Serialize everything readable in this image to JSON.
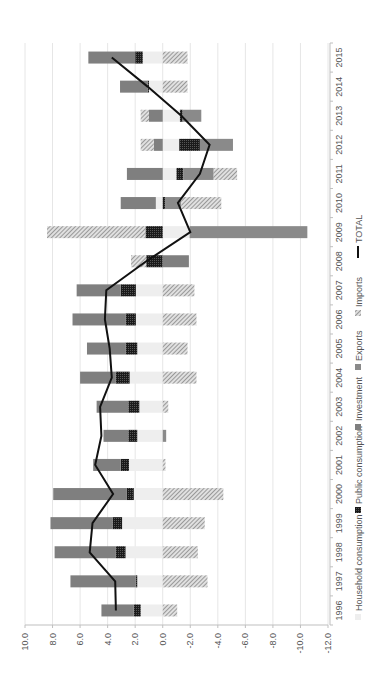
{
  "chart_data": {
    "type": "bar",
    "subtype": "stacked-horizontal-with-line (rotated 90deg)",
    "title": "",
    "xlabel": "",
    "ylabel": "",
    "value_axis": {
      "min": -12.0,
      "max": 10.0,
      "step": 2.0,
      "ticks": [
        "10.0",
        "8.0",
        "6.0",
        "4.0",
        "2.0",
        "0.0",
        "-2.0",
        "-4.0",
        "-6.0",
        "-8.0",
        "-10.0",
        "-12.0"
      ]
    },
    "grid": true,
    "legend_position": "bottom",
    "categories": [
      "1996",
      "1997",
      "1998",
      "1999",
      "2000",
      "2001",
      "2002",
      "2003",
      "2004",
      "2005",
      "2006",
      "2007",
      "2008",
      "2009",
      "2010",
      "2011",
      "2012",
      "2013",
      "2014",
      "2015"
    ],
    "series": [
      {
        "name": "Household consumption",
        "color": "#eeeeee",
        "pattern": "solid",
        "values": [
          1.6,
          1.85,
          2.7,
          2.95,
          2.1,
          2.45,
          1.85,
          1.7,
          2.4,
          1.85,
          1.95,
          1.95,
          0.0,
          -2.0,
          0.5,
          -1.0,
          -1.2,
          -1.25,
          1.0,
          1.45
        ]
      },
      {
        "name": "Public consumption",
        "color": "#222222",
        "pattern": "dots",
        "values": [
          0.5,
          0.1,
          0.7,
          0.7,
          0.5,
          0.6,
          0.65,
          0.8,
          1.0,
          0.85,
          0.75,
          1.1,
          1.2,
          1.25,
          -0.2,
          -0.5,
          -1.5,
          -0.2,
          0.1,
          0.55
        ]
      },
      {
        "name": "Investment",
        "color": "#7f7f7f",
        "pattern": "solid",
        "values": [
          2.35,
          4.75,
          4.45,
          4.5,
          5.35,
          2.0,
          1.8,
          2.3,
          2.6,
          2.8,
          3.85,
          3.2,
          -1.9,
          0.0,
          2.55,
          2.6,
          0.65,
          1.0,
          2.0,
          3.4
        ]
      },
      {
        "name": "Exports",
        "color": "#8c8c8c",
        "pattern": "solid",
        "values": [
          0.0,
          0.0,
          0.0,
          0.0,
          0.0,
          0.0,
          -0.25,
          0.0,
          0.0,
          0.0,
          0.0,
          0.0,
          0.0,
          -8.55,
          -1.15,
          -2.2,
          -2.4,
          -1.35,
          0.0,
          0.0
        ]
      },
      {
        "name": "Imports",
        "color": "#9a9a9a",
        "pattern": "hatch",
        "values": [
          -1.05,
          -3.25,
          -2.55,
          -3.05,
          -4.4,
          -0.2,
          0.0,
          -0.4,
          -2.45,
          -1.8,
          -2.45,
          -2.3,
          1.1,
          7.15,
          -2.9,
          -1.7,
          0.95,
          0.6,
          -1.8,
          -1.8
        ]
      },
      {
        "name": "TOTAL",
        "color": "#111111",
        "type": "line",
        "values": [
          3.4,
          3.45,
          5.3,
          5.1,
          3.6,
          4.9,
          4.45,
          4.55,
          3.7,
          3.85,
          4.2,
          4.1,
          1.2,
          -2.0,
          -1.1,
          -2.7,
          -3.4,
          -1.35,
          1.1,
          3.7
        ]
      }
    ],
    "segments": [
      {
        "year": "1996",
        "household": [
          0,
          1.6
        ],
        "public": [
          1.6,
          2.1
        ],
        "investment": [
          2.1,
          4.45
        ],
        "exports": null,
        "imports": [
          0,
          -1.05
        ]
      },
      {
        "year": "1997",
        "household": [
          0,
          1.85
        ],
        "public": [
          1.85,
          1.95
        ],
        "investment": [
          1.95,
          6.7
        ],
        "exports": null,
        "imports": [
          0,
          -3.25
        ]
      },
      {
        "year": "1998",
        "household": [
          0,
          2.7
        ],
        "public": [
          2.7,
          3.4
        ],
        "investment": [
          3.4,
          7.85
        ],
        "exports": null,
        "imports": [
          0,
          -2.55
        ]
      },
      {
        "year": "1999",
        "household": [
          0,
          2.95
        ],
        "public": [
          2.95,
          3.65
        ],
        "investment": [
          3.65,
          8.15
        ],
        "exports": null,
        "imports": [
          0,
          -3.05
        ]
      },
      {
        "year": "2000",
        "household": [
          0,
          2.1
        ],
        "public": [
          2.1,
          2.6
        ],
        "investment": [
          2.6,
          7.95
        ],
        "exports": null,
        "imports": [
          0,
          -4.4
        ]
      },
      {
        "year": "2001",
        "household": [
          0,
          2.45
        ],
        "public": [
          2.45,
          3.05
        ],
        "investment": [
          3.05,
          5.05
        ],
        "exports": null,
        "imports": [
          0,
          -0.2
        ]
      },
      {
        "year": "2002",
        "household": [
          0,
          1.85
        ],
        "public": [
          1.85,
          2.5
        ],
        "investment": [
          2.5,
          4.3
        ],
        "exports": [
          0,
          -0.25
        ],
        "imports": null
      },
      {
        "year": "2003",
        "household": [
          0,
          1.7
        ],
        "public": [
          1.7,
          2.5
        ],
        "investment": [
          2.5,
          4.8
        ],
        "exports": null,
        "imports": [
          0,
          -0.4
        ]
      },
      {
        "year": "2004",
        "household": [
          0,
          2.4
        ],
        "public": [
          2.4,
          3.4
        ],
        "investment": [
          3.4,
          6.0
        ],
        "exports": null,
        "imports": [
          0,
          -2.45
        ]
      },
      {
        "year": "2005",
        "household": [
          0,
          1.85
        ],
        "public": [
          1.85,
          2.7
        ],
        "investment": [
          2.7,
          5.5
        ],
        "exports": null,
        "imports": [
          0,
          -1.8
        ]
      },
      {
        "year": "2006",
        "household": [
          0,
          1.95
        ],
        "public": [
          1.95,
          2.7
        ],
        "investment": [
          2.7,
          6.55
        ],
        "exports": null,
        "imports": [
          0,
          -2.45
        ]
      },
      {
        "year": "2007",
        "household": [
          0,
          1.95
        ],
        "public": [
          1.95,
          3.05
        ],
        "investment": [
          3.05,
          6.25
        ],
        "exports": null,
        "imports": [
          0,
          -2.3
        ]
      },
      {
        "year": "2008",
        "household": null,
        "public": [
          0,
          1.2
        ],
        "investment": [
          0,
          -1.9
        ],
        "exports": null,
        "imports": [
          1.2,
          2.3
        ]
      },
      {
        "year": "2009",
        "household": [
          0,
          -1.95
        ],
        "public": [
          0,
          1.25
        ],
        "investment": null,
        "exports": [
          -1.95,
          -10.5
        ],
        "imports": [
          1.25,
          8.4
        ]
      },
      {
        "year": "2010",
        "household": [
          0,
          0.5
        ],
        "public": [
          0,
          -0.2
        ],
        "investment": [
          0.5,
          3.05
        ],
        "exports": [
          -0.2,
          -1.35
        ],
        "imports": [
          -1.35,
          -4.25
        ]
      },
      {
        "year": "2011",
        "household": [
          0,
          -1.0
        ],
        "public": [
          -1.0,
          -1.5
        ],
        "investment": [
          0,
          2.6
        ],
        "exports": [
          -1.5,
          -3.7
        ],
        "imports": [
          -3.7,
          -5.4
        ]
      },
      {
        "year": "2012",
        "household": [
          0,
          -1.2
        ],
        "public": [
          -1.2,
          -2.7
        ],
        "investment": [
          0,
          0.65
        ],
        "exports": [
          -2.7,
          -5.1
        ],
        "imports": [
          0.65,
          1.6
        ]
      },
      {
        "year": "2013",
        "household": [
          0,
          -1.25
        ],
        "public": [
          -1.25,
          -1.45
        ],
        "investment": [
          0,
          1.0
        ],
        "exports": [
          -1.45,
          -2.8
        ],
        "imports": [
          1.0,
          1.6
        ]
      },
      {
        "year": "2014",
        "household": [
          0,
          1.0
        ],
        "public": [
          1.0,
          1.1
        ],
        "investment": [
          1.1,
          3.1
        ],
        "exports": null,
        "imports": [
          0,
          -1.8
        ]
      },
      {
        "year": "2015",
        "household": [
          0,
          1.45
        ],
        "public": [
          1.45,
          2.0
        ],
        "investment": [
          2.0,
          5.4
        ],
        "exports": null,
        "imports": [
          0,
          -1.8
        ]
      }
    ]
  },
  "legend": {
    "items": [
      {
        "label": "Household consumption",
        "key": "household"
      },
      {
        "label": "Public consumption",
        "key": "public"
      },
      {
        "label": "Investment",
        "key": "investment"
      },
      {
        "label": "Exports",
        "key": "exports"
      },
      {
        "label": "Imports",
        "key": "imports"
      },
      {
        "label": "TOTAL",
        "key": "total"
      }
    ]
  },
  "colors": {
    "household": "#eeeeee",
    "public": "#222222",
    "investment": "#7f7f7f",
    "exports": "#8a8a8a",
    "imports": "#9a9a9a",
    "total": "#111111",
    "grid": "#e6e6e6",
    "axis": "#bfbfbf"
  }
}
